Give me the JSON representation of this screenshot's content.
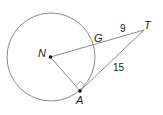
{
  "diagram": {
    "type": "geometry-circle-tangent",
    "circle": {
      "center_label": "N",
      "cx": 51,
      "cy": 57,
      "r": 44
    },
    "points": {
      "N": {
        "label": "N",
        "x": 50.5,
        "y": 57
      },
      "A": {
        "label": "A",
        "x": 80,
        "y": 91
      },
      "G": {
        "label": "G",
        "x": 95,
        "y": 45
      },
      "T": {
        "label": "T",
        "x": 144,
        "y": 30
      }
    },
    "segments": [
      {
        "from": "N",
        "to": "T",
        "through": "G"
      },
      {
        "from": "N",
        "to": "A"
      },
      {
        "from": "A",
        "to": "T"
      }
    ],
    "measures": {
      "GT": "9",
      "AT": "15"
    },
    "right_angle_at": "A",
    "colors": {
      "line": "#888888",
      "text": "#1a1a1a",
      "point": "#111111"
    }
  }
}
